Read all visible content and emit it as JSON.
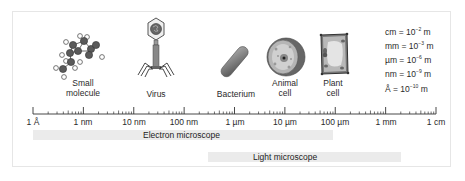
{
  "figure": {
    "organisms": [
      {
        "id": "small-molecule",
        "label_line1": "Small",
        "label_line2": "molecule"
      },
      {
        "id": "virus",
        "label_line1": "Virus"
      },
      {
        "id": "bacterium",
        "label_line1": "Bacterium"
      },
      {
        "id": "animal-cell",
        "label_line1": "Animal",
        "label_line2": "cell"
      },
      {
        "id": "plant-cell",
        "label_line1": "Plant",
        "label_line2": "cell"
      }
    ],
    "units_legend": [
      {
        "unit": "cm",
        "exp": "−2"
      },
      {
        "unit": "mm",
        "exp": "−3"
      },
      {
        "unit": "µm",
        "exp": "−6"
      },
      {
        "unit": "nm",
        "exp": "−9"
      },
      {
        "unit": "Å",
        "exp": "−10"
      }
    ],
    "legend_eq": " = 10",
    "legend_m": "m",
    "scale_labels": [
      "1 Å",
      "1 nm",
      "10 nm",
      "100 nm",
      "1 µm",
      "10 µm",
      "100 µm",
      "1 mm",
      "1 cm"
    ],
    "ranges": [
      {
        "id": "electron",
        "label": "Electron microscope"
      },
      {
        "id": "light",
        "label": "Light microscope"
      }
    ],
    "colors": {
      "bar_fill": "#ebebeb",
      "frame_border": "#e6e6e6",
      "atom_dark": "#555555",
      "virus_head": "#eeeeee",
      "bacterium": "#707070",
      "ruler": "#333333"
    }
  }
}
